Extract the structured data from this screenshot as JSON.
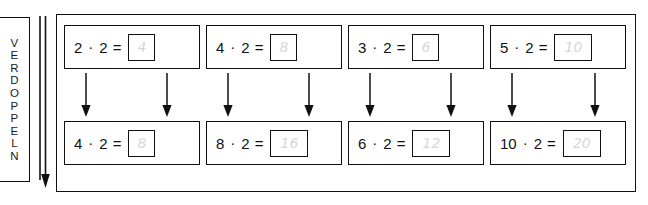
{
  "worksheet": {
    "side_label": "VERDOPPELN",
    "side_label_letters": [
      "V",
      "E",
      "R",
      "D",
      "O",
      "P",
      "P",
      "E",
      "L",
      "N"
    ],
    "operator_symbol": "·",
    "equals_symbol": "=",
    "answer_color": "#d7d7d7",
    "border_color": "#111111",
    "groups": [
      {
        "top": {
          "left_factor": "2",
          "right_factor": "2",
          "answer": "4"
        },
        "bottom": {
          "left_factor": "4",
          "right_factor": "2",
          "answer": "8"
        }
      },
      {
        "top": {
          "left_factor": "4",
          "right_factor": "2",
          "answer": "8"
        },
        "bottom": {
          "left_factor": "8",
          "right_factor": "2",
          "answer": "16"
        }
      },
      {
        "top": {
          "left_factor": "3",
          "right_factor": "2",
          "answer": "6"
        },
        "bottom": {
          "left_factor": "6",
          "right_factor": "2",
          "answer": "12"
        }
      },
      {
        "top": {
          "left_factor": "5",
          "right_factor": "2",
          "answer": "10"
        },
        "bottom": {
          "left_factor": "10",
          "right_factor": "2",
          "answer": "20"
        }
      }
    ]
  }
}
